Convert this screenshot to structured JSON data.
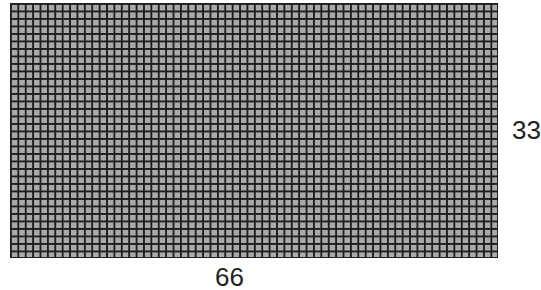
{
  "diagram": {
    "type": "grid",
    "columns": 66,
    "rows": 34,
    "cell_fill": "#a9a9a9",
    "line_color": "#1e1e1e"
  },
  "labels": {
    "right": "33",
    "bottom": "66"
  }
}
